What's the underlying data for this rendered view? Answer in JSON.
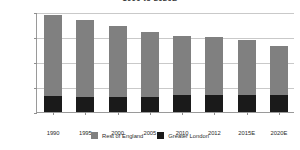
{
  "chart_data": {
    "type": "bar",
    "stacked": true,
    "title": "1990 to 2020E",
    "xlabel": "",
    "ylabel": "",
    "categories": [
      "1990",
      "1995",
      "2000",
      "2005",
      "2010",
      "2012",
      "2015E",
      "2020E"
    ],
    "series": [
      {
        "name": "Greater London",
        "color": "#1a1a1a",
        "values": [
          630000,
          620000,
          615000,
          615000,
          665000,
          700000,
          690000,
          665000
        ]
      },
      {
        "name": "Rest of England",
        "color": "#808080",
        "values": [
          3270000,
          3050000,
          2815000,
          2605000,
          2385000,
          2300000,
          2190000,
          1985000
        ]
      }
    ],
    "totals": [
      3900000,
      3670000,
      3430000,
      3220000,
      3050000,
      3000000,
      2880000,
      2650000
    ],
    "ylim": [
      0,
      4000000
    ],
    "ytick_values": [
      0,
      1000000,
      2000000,
      3000000,
      4000000
    ],
    "ytick_labels": [
      "0",
      "1,000,000",
      "2,000,000",
      "3,000,000",
      "4,000,000"
    ],
    "grid": true,
    "legend_position": "bottom"
  },
  "legend": {
    "entries": [
      {
        "label": "Rest of England",
        "color": "#808080",
        "swatch_name": "legend-swatch-rest-of-england"
      },
      {
        "label": "Greater London",
        "color": "#1a1a1a",
        "swatch_name": "legend-swatch-greater-london"
      }
    ]
  },
  "colors": {
    "background": "#ffffff",
    "axis": "#9a9a9a",
    "gridline": "#c9c9c9",
    "text": "#2b2b2b",
    "series_rest_of_england": "#808080",
    "series_greater_london": "#1a1a1a"
  }
}
